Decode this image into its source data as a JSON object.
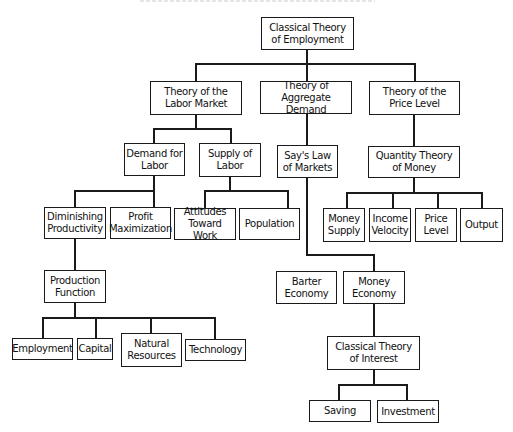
{
  "diagram": {
    "type": "hierarchy-tree",
    "root": {
      "label": "Classical Theory\nof Employment",
      "children": [
        {
          "label": "Theory of the\nLabor Market",
          "children": [
            {
              "label": "Demand for\nLabor",
              "children": [
                {
                  "label": "Diminishing\nProductivity",
                  "children": [
                    {
                      "label": "Production\nFunction",
                      "children": [
                        {
                          "label": "Employment"
                        },
                        {
                          "label": "Capital"
                        },
                        {
                          "label": "Natural\nResources"
                        },
                        {
                          "label": "Technology"
                        }
                      ]
                    }
                  ]
                },
                {
                  "label": "Profit\nMaximization"
                }
              ]
            },
            {
              "label": "Supply of\nLabor",
              "children": [
                {
                  "label": "Attitudes\nToward Work"
                },
                {
                  "label": "Population"
                }
              ]
            }
          ]
        },
        {
          "label": "Theory of\nAggregate Demand",
          "children": [
            {
              "label": "Say's Law\nof Markets",
              "children": [
                {
                  "label": "Barter\nEconomy"
                },
                {
                  "label": "Money\nEconomy",
                  "children": [
                    {
                      "label": "Classical Theory\nof Interest",
                      "children": [
                        {
                          "label": "Saving"
                        },
                        {
                          "label": "Investment"
                        }
                      ]
                    }
                  ]
                }
              ]
            }
          ]
        },
        {
          "label": "Theory of the\nPrice Level",
          "children": [
            {
              "label": "Quantity Theory\nof Money",
              "children": [
                {
                  "label": "Money\nSupply"
                },
                {
                  "label": "Income\nVelocity"
                },
                {
                  "label": "Price\nLevel"
                },
                {
                  "label": "Output"
                }
              ]
            }
          ]
        }
      ]
    }
  },
  "nodes": {
    "classical_employment": "Classical Theory\nof Employment",
    "labor_market": "Theory of the\nLabor Market",
    "aggregate_demand": "Theory of\nAggregate Demand",
    "price_level_theory": "Theory of the\nPrice Level",
    "demand_for_labor": "Demand for\nLabor",
    "supply_of_labor": "Supply of\nLabor",
    "says_law": "Say's Law\nof Markets",
    "quantity_theory": "Quantity Theory\nof Money",
    "diminishing_productivity": "Diminishing\nProductivity",
    "profit_maximization": "Profit\nMaximization",
    "attitudes": "Attitudes\nToward Work",
    "population": "Population",
    "money_supply": "Money\nSupply",
    "income_velocity": "Income\nVelocity",
    "price_level": "Price\nLevel",
    "output": "Output",
    "production_function": "Production\nFunction",
    "barter_economy": "Barter\nEconomy",
    "money_economy": "Money\nEconomy",
    "employment": "Employment",
    "capital": "Capital",
    "natural_resources": "Natural\nResources",
    "technology": "Technology",
    "classical_interest": "Classical Theory\nof Interest",
    "saving": "Saving",
    "investment": "Investment"
  }
}
